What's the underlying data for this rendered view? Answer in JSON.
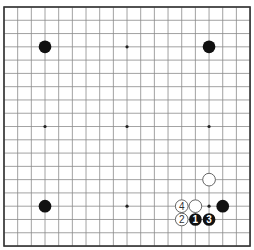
{
  "board": {
    "size": 19,
    "origin": {
      "x": 4,
      "y": 7
    },
    "spacing": {
      "x": 13.67,
      "y": 13.28
    },
    "colors": {
      "background": "#ffffff",
      "grid": "#8a8a8a",
      "border": "#333333",
      "black_stone": "#111111",
      "white_stone": "#ffffff"
    },
    "star_points": [
      [
        3,
        3
      ],
      [
        9,
        3
      ],
      [
        15,
        3
      ],
      [
        3,
        9
      ],
      [
        9,
        9
      ],
      [
        15,
        9
      ],
      [
        3,
        15
      ],
      [
        9,
        15
      ],
      [
        15,
        15
      ]
    ],
    "stones": [
      {
        "coord": "D16",
        "col": 3,
        "row": 3,
        "color": "black",
        "label": ""
      },
      {
        "coord": "Q16",
        "col": 15,
        "row": 3,
        "color": "black",
        "label": ""
      },
      {
        "coord": "D4",
        "col": 3,
        "row": 15,
        "color": "black",
        "label": ""
      },
      {
        "coord": "Q6",
        "col": 15,
        "row": 13,
        "color": "white",
        "label": ""
      },
      {
        "coord": "O4",
        "col": 13,
        "row": 15,
        "color": "white",
        "label": "4"
      },
      {
        "coord": "P4",
        "col": 14,
        "row": 15,
        "color": "white",
        "label": ""
      },
      {
        "coord": "R4",
        "col": 16,
        "row": 15,
        "color": "black",
        "label": ""
      },
      {
        "coord": "O3",
        "col": 13,
        "row": 16,
        "color": "white",
        "label": "2"
      },
      {
        "coord": "P3",
        "col": 14,
        "row": 16,
        "color": "black",
        "label": "1"
      },
      {
        "coord": "Q3",
        "col": 15,
        "row": 16,
        "color": "black",
        "label": "3"
      }
    ]
  }
}
